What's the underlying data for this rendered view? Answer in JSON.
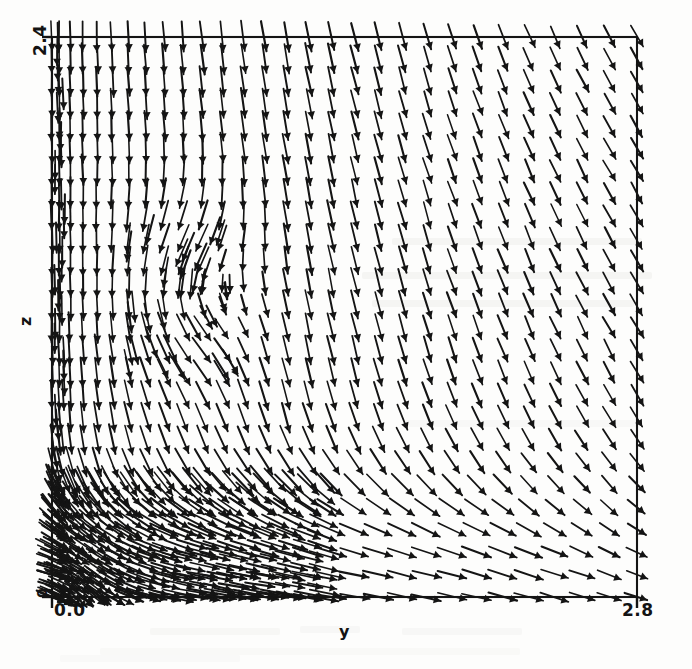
{
  "figure": {
    "kind": "vector-field-quiver-plot",
    "background_color": "#fdfdfc",
    "ink_color": "#141414",
    "caption_visible": false
  },
  "axes": {
    "frame_color": "#141414",
    "x_axis": {
      "label": "y",
      "min_tick_label": "0.0",
      "max_tick_label": "2.8",
      "min": 0.0,
      "max": 2.8,
      "ticks": [
        0.0,
        2.8
      ],
      "tick_labels": [
        "0.0",
        "2.8"
      ]
    },
    "y_axis": {
      "label": "z",
      "min_tick_label": "0",
      "max_tick_label": "2.4",
      "min": 0.0,
      "max": 2.4,
      "ticks": [
        0.0,
        2.4
      ],
      "tick_labels": [
        "0",
        "2.4"
      ],
      "labels_rotated": true
    }
  },
  "chart_data": {
    "type": "scatter",
    "title": "",
    "xlabel": "y",
    "ylabel": "z",
    "xlim": [
      0.0,
      2.8
    ],
    "ylim": [
      0.0,
      2.4
    ],
    "grid": false,
    "legend": null,
    "field_type": "velocity vector field (quiver) of an impinging / wall jet with corner recirculation",
    "notes": [
      "Arrows over the whole domain point predominantly downward (negative z velocity).",
      "Near the left wall (y approx 0) a fast downward jet impinges on the bottom wall at z = 0 and turns outward in +y, producing a dense wall jet.",
      "A small counter-rotating recirculation vortex sits near y approx 0.62, z approx 1.28.",
      "Toward the right boundary (y -> 2.8) arrow magnitudes shrink and tilt slightly, indicating weak entrained downflow."
    ],
    "grid_columns": 29,
    "grid_rows": 26,
    "vortex_center": {
      "y": 0.62,
      "z": 1.28
    },
    "impingement_point": {
      "y": 0.08,
      "z": 0.0
    },
    "sample_vectors": [
      {
        "y": 0.1,
        "z": 2.35,
        "u": 0.01,
        "v": -0.92,
        "magnitude": 0.92
      },
      {
        "y": 0.6,
        "z": 2.35,
        "u": 0.02,
        "v": -0.88,
        "magnitude": 0.88
      },
      {
        "y": 1.4,
        "z": 2.35,
        "u": 0.05,
        "v": -0.74,
        "magnitude": 0.74
      },
      {
        "y": 2.2,
        "z": 2.35,
        "u": 0.12,
        "v": -0.52,
        "magnitude": 0.53
      },
      {
        "y": 2.7,
        "z": 2.35,
        "u": 0.18,
        "v": -0.36,
        "magnitude": 0.4
      },
      {
        "y": 0.1,
        "z": 1.6,
        "u": 0.0,
        "v": -0.95,
        "magnitude": 0.95
      },
      {
        "y": 0.62,
        "z": 1.28,
        "u": 0.02,
        "v": 0.03,
        "magnitude": 0.04
      },
      {
        "y": 1.4,
        "z": 1.2,
        "u": 0.03,
        "v": -0.7,
        "magnitude": 0.7
      },
      {
        "y": 2.7,
        "z": 1.2,
        "u": 0.2,
        "v": -0.3,
        "magnitude": 0.36
      },
      {
        "y": 0.1,
        "z": 0.35,
        "u": 0.35,
        "v": -0.7,
        "magnitude": 0.78
      },
      {
        "y": 0.45,
        "z": 0.12,
        "u": 0.82,
        "v": -0.16,
        "magnitude": 0.84
      },
      {
        "y": 1.2,
        "z": 0.08,
        "u": 0.6,
        "v": -0.06,
        "magnitude": 0.6
      },
      {
        "y": 2.1,
        "z": 0.08,
        "u": 0.4,
        "v": -0.05,
        "magnitude": 0.4
      },
      {
        "y": 2.7,
        "z": 0.08,
        "u": 0.26,
        "v": -0.04,
        "magnitude": 0.26
      }
    ]
  }
}
